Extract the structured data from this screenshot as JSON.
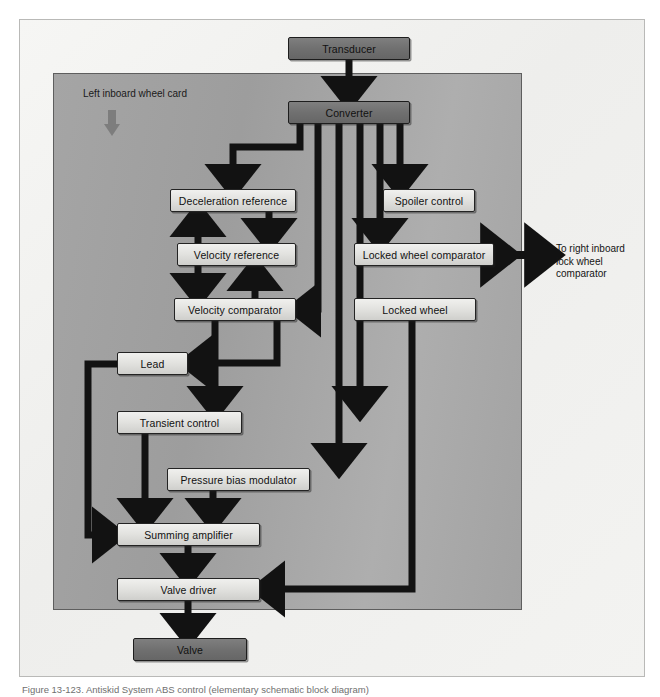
{
  "figure": {
    "caption": "Figure 13-123. Antiskid System ABS control (elementary schematic block diagram)",
    "card_label": "Left inboard wheel card",
    "external_note": "To right inboard\nlock wheel\ncomparator",
    "colors": {
      "page_background": "#ffffff",
      "outer_card": "#f2f2f0",
      "inner_panel": "#a5a5a5",
      "node_light": "#e2e2df",
      "node_dark": "#707070",
      "stroke": "#1d1d1d",
      "card_arrow": "#7d7d7d"
    }
  },
  "nodes": [
    {
      "id": "transducer",
      "label": "Transducer",
      "style": "dark",
      "x": 288,
      "y": 37,
      "w": 122,
      "h": 23
    },
    {
      "id": "converter",
      "label": "Converter",
      "style": "dark",
      "x": 288,
      "y": 101,
      "w": 122,
      "h": 23
    },
    {
      "id": "deceleration-reference",
      "label": "Deceleration reference",
      "style": "light",
      "x": 170,
      "y": 189,
      "w": 126,
      "h": 23
    },
    {
      "id": "spoiler-control",
      "label": "Spoiler control",
      "style": "light",
      "x": 383,
      "y": 189,
      "w": 92,
      "h": 23
    },
    {
      "id": "velocity-reference",
      "label": "Velocity reference",
      "style": "light",
      "x": 177,
      "y": 243,
      "w": 119,
      "h": 23
    },
    {
      "id": "locked-wheel-comparator",
      "label": "Locked wheel comparator",
      "style": "light",
      "x": 354,
      "y": 243,
      "w": 140,
      "h": 23
    },
    {
      "id": "velocity-comparator",
      "label": "Velocity comparator",
      "style": "light",
      "x": 174,
      "y": 298,
      "w": 122,
      "h": 23
    },
    {
      "id": "locked-wheel",
      "label": "Locked wheel",
      "style": "light",
      "x": 354,
      "y": 298,
      "w": 122,
      "h": 23
    },
    {
      "id": "lead",
      "label": "Lead",
      "style": "light",
      "x": 117,
      "y": 352,
      "w": 71,
      "h": 23
    },
    {
      "id": "transient-control",
      "label": "Transient control",
      "style": "light",
      "x": 117,
      "y": 411,
      "w": 125,
      "h": 23
    },
    {
      "id": "pressure-bias-modulator",
      "label": "Pressure bias modulator",
      "style": "light",
      "x": 167,
      "y": 468,
      "w": 143,
      "h": 23
    },
    {
      "id": "summing-amplifier",
      "label": "Summing amplifier",
      "style": "light",
      "x": 117,
      "y": 523,
      "w": 143,
      "h": 23
    },
    {
      "id": "valve-driver",
      "label": "Valve driver",
      "style": "light",
      "x": 117,
      "y": 578,
      "w": 143,
      "h": 23
    },
    {
      "id": "valve",
      "label": "Valve",
      "style": "dark",
      "x": 133,
      "y": 638,
      "w": 114,
      "h": 23
    }
  ],
  "connections": [
    {
      "from": "transducer",
      "to": "converter",
      "kind": "vertical-arrow"
    },
    {
      "from": "converter",
      "to": "deceleration-reference",
      "kind": "elbow-left-down"
    },
    {
      "from": "converter",
      "to": "velocity-comparator",
      "kind": "elbow-down-left"
    },
    {
      "from": "converter",
      "to": "pressure-bias-modulator",
      "kind": "vertical-arrow"
    },
    {
      "from": "converter",
      "to": "transient-control",
      "kind": "vertical-arrow"
    },
    {
      "from": "converter",
      "to": "spoiler-control",
      "kind": "vertical-arrow"
    },
    {
      "from": "converter",
      "to": "locked-wheel-comparator",
      "kind": "vertical-arrow"
    },
    {
      "from": "velocity-reference",
      "to": "deceleration-reference",
      "kind": "vertical-arrow-up"
    },
    {
      "from": "deceleration-reference",
      "to": "velocity-reference",
      "kind": "vertical-arrow"
    },
    {
      "from": "velocity-reference",
      "to": "velocity-comparator",
      "kind": "vertical-arrow"
    },
    {
      "from": "velocity-comparator",
      "to": "velocity-reference",
      "kind": "vertical-arrow-up"
    },
    {
      "from": "velocity-comparator",
      "to": "lead",
      "kind": "elbow"
    },
    {
      "from": "velocity-comparator",
      "to": "transient-control",
      "kind": "vertical-arrow"
    },
    {
      "from": "lead",
      "to": "summing-amplifier",
      "kind": "elbow-left-down"
    },
    {
      "from": "transient-control",
      "to": "summing-amplifier",
      "kind": "vertical-arrow"
    },
    {
      "from": "pressure-bias-modulator",
      "to": "summing-amplifier",
      "kind": "vertical-arrow"
    },
    {
      "from": "summing-amplifier",
      "to": "valve-driver",
      "kind": "vertical-arrow"
    },
    {
      "from": "valve-driver",
      "to": "valve",
      "kind": "vertical-arrow"
    },
    {
      "from": "locked-wheel",
      "to": "valve-driver",
      "kind": "elbow-down-left"
    },
    {
      "from": "locked-wheel-comparator",
      "to": "external",
      "kind": "double-arrow"
    }
  ]
}
